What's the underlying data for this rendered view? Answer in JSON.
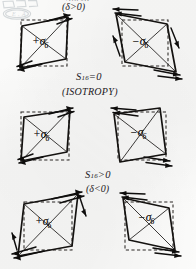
{
  "figure": {
    "kind": "hand-drawn-scientific-diagram",
    "ink_color": "#141210",
    "dashed_color": "#2a2724",
    "paper_color": "#fbfbfa",
    "stamp": {
      "name": "library-stamp-watermark",
      "legible": false,
      "text": ""
    },
    "rows": [
      {
        "id": "row-top",
        "heading": "S",
        "heading_sub": "16",
        "heading_rel": "<0",
        "heading_cut_off": true,
        "condition": "(δ>0)",
        "panels": [
          {
            "id": "panel-top-left",
            "label_sign": "+",
            "label_symbol": "σ",
            "label_sub": "6",
            "label_full": "+σ₆"
          },
          {
            "id": "panel-top-right",
            "label_sign": "−",
            "label_symbol": "σ",
            "label_sub": "6",
            "label_full": "−σ₆"
          }
        ]
      },
      {
        "id": "row-middle",
        "heading": "S",
        "heading_sub": "16",
        "heading_rel": "=0",
        "heading_cut_off": false,
        "condition": "(ISOTROPY)",
        "panels": [
          {
            "id": "panel-mid-left",
            "label_sign": "+",
            "label_symbol": "σ",
            "label_sub": "6",
            "label_full": "+σ₆"
          },
          {
            "id": "panel-mid-right",
            "label_sign": "−",
            "label_symbol": "σ",
            "label_sub": "6",
            "label_full": "−σ₆"
          }
        ]
      },
      {
        "id": "row-bottom",
        "heading": "S",
        "heading_sub": "16",
        "heading_rel": ">0",
        "heading_cut_off": false,
        "condition": "(δ<0)",
        "panels": [
          {
            "id": "panel-bot-left",
            "label_sign": "+",
            "label_symbol": "σ",
            "label_sub": "6",
            "label_full": "+σ₆"
          },
          {
            "id": "panel-bot-right",
            "label_sign": "−",
            "label_symbol": "σ",
            "label_sub": "6",
            "label_full": "−σ₆"
          }
        ]
      }
    ]
  }
}
